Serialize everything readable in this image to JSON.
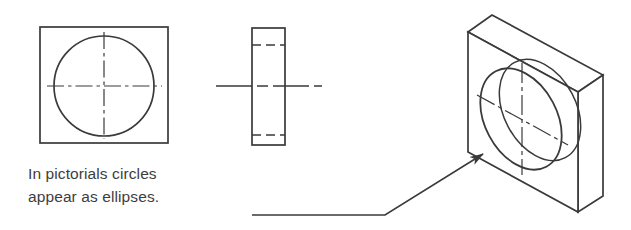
{
  "figure": {
    "stroke_color": "#3a3a3a",
    "text_color": "#3d3d3d",
    "background_color": "#ffffff",
    "annotation": {
      "line1": "In pictorials circles",
      "line2": "appear as ellipses.",
      "full_text": "In pictorials circles appear as ellipses.",
      "leader_icon": "leader-line-with-arrowhead"
    },
    "views": [
      {
        "name": "front-view",
        "label": "front view square with circle",
        "shape": "square",
        "outline": {
          "x": 40,
          "y": 27,
          "width": 128,
          "height": 116
        },
        "circle": {
          "cx": 104,
          "cy": 86,
          "r": 50
        },
        "centerlines": [
          {
            "type": "horizontal",
            "x1": 47,
            "y1": 86,
            "x2": 162,
            "y2": 86
          },
          {
            "type": "vertical",
            "x1": 104,
            "y1": 32,
            "x2": 104,
            "y2": 139
          }
        ],
        "line_style_outline": "visible-solid",
        "line_style_center": "dash-dot"
      },
      {
        "name": "side-view",
        "label": "side view rectangle with hidden lines",
        "shape": "rectangle",
        "outline": {
          "x": 252,
          "y": 28,
          "width": 33,
          "height": 117
        },
        "hidden_lines": [
          {
            "x1": 252,
            "y1": 45,
            "x2": 285,
            "y2": 45
          },
          {
            "x1": 252,
            "y1": 135,
            "x2": 285,
            "y2": 135
          }
        ],
        "centerlines": [
          {
            "type": "horizontal",
            "x1": 216,
            "y1": 86,
            "x2": 322,
            "y2": 86
          }
        ],
        "line_style_outline": "visible-solid",
        "line_style_hidden": "dashed",
        "line_style_center": "dash-dot"
      },
      {
        "name": "pictorial-view",
        "label": "isometric pictorial block with elliptical hole",
        "shape": "isometric-block",
        "front_face": [
          {
            "x": 468,
            "y": 32
          },
          {
            "x": 578,
            "y": 92
          },
          {
            "x": 578,
            "y": 212
          },
          {
            "x": 468,
            "y": 152
          }
        ],
        "top_face": [
          {
            "x": 468,
            "y": 32
          },
          {
            "x": 492,
            "y": 15
          },
          {
            "x": 603,
            "y": 75
          },
          {
            "x": 578,
            "y": 92
          }
        ],
        "right_face": [
          {
            "x": 578,
            "y": 92
          },
          {
            "x": 603,
            "y": 75
          },
          {
            "x": 603,
            "y": 196
          },
          {
            "x": 578,
            "y": 212
          }
        ],
        "front_ellipse": {
          "cx": 521,
          "cy": 119,
          "rx": 36,
          "ry": 54,
          "rotation": -28
        },
        "back_ellipse": {
          "cx": 540,
          "cy": 110,
          "rx": 36,
          "ry": 54,
          "rotation": -28
        },
        "centerlines": [
          {
            "type": "vertical",
            "x1": 522,
            "y1": 63,
            "x2": 522,
            "y2": 175
          },
          {
            "type": "oblique",
            "x1": 477,
            "y1": 95,
            "x2": 568,
            "y2": 145
          }
        ],
        "line_style_outline": "visible-solid",
        "line_style_center": "dash-dot"
      }
    ],
    "leader": {
      "name": "annotation-leader",
      "segments": [
        {
          "x1": 252,
          "y1": 215,
          "x2": 385,
          "y2": 215
        },
        {
          "x1": 385,
          "y1": 215,
          "x2": 487,
          "y2": 151
        }
      ],
      "arrowhead": {
        "x": 487,
        "y": 151,
        "angle": -32
      }
    }
  }
}
